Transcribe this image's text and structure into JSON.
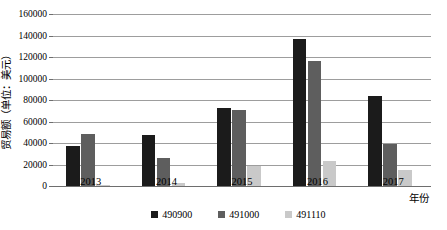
{
  "chart_data": {
    "type": "bar",
    "title": "",
    "xlabel": "年份",
    "ylabel": "贸易额（单位：美元）",
    "categories": [
      "2013",
      "2014",
      "2015",
      "2016",
      "2017"
    ],
    "series": [
      {
        "name": "490900",
        "color": "#1b1b1b",
        "values": [
          37500,
          47000,
          73000,
          137000,
          84000
        ]
      },
      {
        "name": "491000",
        "color": "#5e5e5e",
        "values": [
          48000,
          26000,
          71000,
          116000,
          39000
        ]
      },
      {
        "name": "491110",
        "color": "#c9c9c9",
        "values": [
          1000,
          2500,
          19000,
          23000,
          15000
        ]
      }
    ],
    "ylim": [
      0,
      160000
    ],
    "yticks": [
      0,
      20000,
      40000,
      60000,
      80000,
      100000,
      120000,
      140000,
      160000
    ],
    "ytick_labels": [
      "0",
      "20000",
      "40000",
      "60000",
      "80000",
      "100000",
      "120000",
      "140000",
      "160000"
    ],
    "grid": true,
    "legend_position": "bottom"
  },
  "legend": {
    "items": [
      {
        "label": "490900",
        "color": "#1b1b1b"
      },
      {
        "label": "491000",
        "color": "#5e5e5e"
      },
      {
        "label": "491110",
        "color": "#c9c9c9"
      }
    ]
  }
}
